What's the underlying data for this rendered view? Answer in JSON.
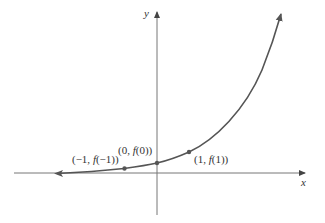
{
  "chart_data": {
    "type": "line",
    "title": "",
    "xlabel": "x",
    "ylabel": "y",
    "function": "exponential growth f(x) = b^x, b > 1",
    "grid": false,
    "legend": null,
    "series": [
      {
        "name": "f(x)",
        "description": "increasing exponential curve approaching the x-axis as x → −∞",
        "points": [
          {
            "x": -1,
            "label": "(−1, f(−1))"
          },
          {
            "x": 0,
            "label": "(0, f(0))"
          },
          {
            "x": 1,
            "label": "(1, f(1))"
          }
        ]
      }
    ],
    "annotations": [
      "(−1, f(−1))",
      "(0, f(0))",
      "(1, f(1))"
    ]
  },
  "axes": {
    "x_label": "x",
    "y_label": "y"
  },
  "points": {
    "p_neg1": "(−1, f(−1))",
    "p0": "(0, f(0))",
    "p1": "(1, f(1))"
  },
  "colors": {
    "axis": "#555555",
    "curve": "#555555",
    "text": "#333333"
  }
}
